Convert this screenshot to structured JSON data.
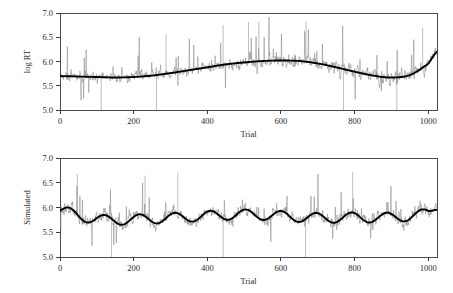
{
  "figure": {
    "background": "#ffffff",
    "panel_count": 2,
    "noisy_color": "#8a8a8a",
    "trend_color": "#000000",
    "axis_color": "#3a3a3a"
  },
  "chart_data": [
    {
      "type": "line",
      "panel": "top",
      "title": "",
      "xlabel": "Trial",
      "ylabel": "log RT",
      "xlim": [
        0,
        1024
      ],
      "ylim": [
        5.0,
        7.0
      ],
      "grid": false,
      "legend": "none",
      "xticks": [
        0,
        200,
        400,
        600,
        800,
        1000
      ],
      "xticklabels": [
        "0",
        "200",
        "400",
        "600",
        "800",
        "1000"
      ],
      "yticks": [
        5.0,
        5.5,
        6.0,
        6.5,
        7.0
      ],
      "yticklabels": [
        "5.0",
        "5.5",
        "6.0",
        "6.5",
        "7.0"
      ],
      "series": [
        {
          "name": "observed log RT",
          "style": "noisy",
          "color": "#8a8a8a",
          "x_start": 0,
          "x_end": 1024,
          "n_points": 1024,
          "baseline_trend_x": [
            0,
            50,
            100,
            150,
            200,
            250,
            300,
            350,
            400,
            450,
            500,
            550,
            600,
            650,
            700,
            750,
            800,
            850,
            900,
            950,
            1000,
            1024
          ],
          "baseline_trend_y": [
            5.7,
            5.69,
            5.68,
            5.67,
            5.68,
            5.71,
            5.76,
            5.82,
            5.88,
            5.94,
            5.98,
            6.01,
            6.02,
            6.01,
            5.96,
            5.88,
            5.79,
            5.71,
            5.67,
            5.72,
            5.95,
            6.2
          ],
          "noise_sd": 0.085,
          "noise_sd_late": 0.13,
          "spike_up_prob": 0.05,
          "spike_down_prob": 0.012,
          "spike_up_max": 0.95,
          "spike_down_max": 0.75,
          "clip_min": 5.0,
          "clip_max": 7.0,
          "notable_down_spikes_x": [
            112,
            262,
            770,
            915
          ],
          "notable_up_spikes_x": [
            288,
            443,
            512,
            540,
            668,
            985
          ]
        },
        {
          "name": "smoothed trend",
          "style": "trend",
          "color": "#000000",
          "x": [
            0,
            50,
            100,
            150,
            200,
            250,
            300,
            350,
            400,
            450,
            500,
            550,
            600,
            650,
            700,
            750,
            800,
            850,
            900,
            950,
            1000,
            1024
          ],
          "y": [
            5.7,
            5.69,
            5.68,
            5.67,
            5.68,
            5.71,
            5.76,
            5.82,
            5.88,
            5.94,
            5.98,
            6.01,
            6.02,
            6.01,
            5.96,
            5.88,
            5.79,
            5.71,
            5.67,
            5.72,
            5.95,
            6.2
          ]
        }
      ]
    },
    {
      "type": "line",
      "panel": "bottom",
      "title": "",
      "xlabel": "Trial",
      "ylabel": "Simulated",
      "xlim": [
        0,
        1024
      ],
      "ylim": [
        5.0,
        7.0
      ],
      "grid": false,
      "legend": "none",
      "xticks": [
        0,
        200,
        400,
        600,
        800,
        1000
      ],
      "xticklabels": [
        "0",
        "200",
        "400",
        "600",
        "800",
        "1000"
      ],
      "yticks": [
        5.0,
        5.5,
        6.0,
        6.5,
        7.0
      ],
      "yticklabels": [
        "5.0",
        "5.5",
        "6.0",
        "6.5",
        "7.0"
      ],
      "series": [
        {
          "name": "simulated log RT",
          "style": "noisy",
          "color": "#8a8a8a",
          "x_start": 0,
          "x_end": 1024,
          "n_points": 1024,
          "baseline_trend_x": [
            0,
            100,
            200,
            300,
            400,
            500,
            600,
            700,
            800,
            900,
            1000,
            1024
          ],
          "baseline_trend_y": [
            5.93,
            5.76,
            5.76,
            5.79,
            5.83,
            5.86,
            5.83,
            5.79,
            5.8,
            5.8,
            5.88,
            6.04
          ],
          "oscillation_amplitude": 0.1,
          "oscillation_period": 96,
          "oscillation_phase": 0.0,
          "noise_sd": 0.105,
          "spike_up_prob": 0.055,
          "spike_down_prob": 0.014,
          "spike_up_max": 0.9,
          "spike_down_max": 0.8,
          "clip_min": 5.0,
          "clip_max": 7.0,
          "notable_down_spikes_x": [
            140,
            443,
            667
          ],
          "notable_up_spikes_x": [
            47,
            231,
            320,
            795
          ]
        },
        {
          "name": "smoothed trend",
          "style": "trend",
          "color": "#000000",
          "oscillating": true,
          "baseline_x": [
            0,
            100,
            200,
            300,
            400,
            500,
            600,
            700,
            800,
            900,
            1000,
            1024
          ],
          "baseline_y": [
            5.93,
            5.76,
            5.76,
            5.79,
            5.83,
            5.86,
            5.83,
            5.79,
            5.8,
            5.8,
            5.88,
            6.04
          ],
          "amplitude": 0.1,
          "period": 96
        }
      ]
    }
  ]
}
